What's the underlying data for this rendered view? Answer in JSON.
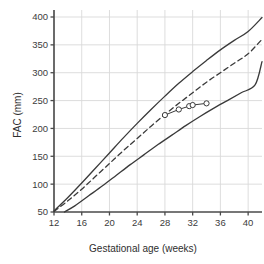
{
  "chart_data": {
    "type": "line",
    "title": "",
    "xlabel": "Gestational age (weeks)",
    "ylabel": "FAC (mm)",
    "xlim": [
      12,
      42
    ],
    "ylim": [
      50,
      400
    ],
    "xticks": [
      12,
      16,
      20,
      24,
      28,
      32,
      36,
      40
    ],
    "yticks": [
      50,
      100,
      150,
      200,
      250,
      300,
      350,
      400
    ],
    "grid": true,
    "legend": "none",
    "colors": {
      "curve": "#3a3a3a",
      "grid": "#d9d9d9",
      "axis": "#555555",
      "marker_fill": "#ffffff",
      "marker_stroke": "#3a3a3a",
      "background": "#ffffff",
      "text": "#333333"
    },
    "series": [
      {
        "name": "upper reference centile",
        "style": "solid",
        "x": [
          12,
          14,
          16,
          18,
          20,
          22,
          24,
          26,
          28,
          30,
          32,
          34,
          36,
          38,
          40,
          42
        ],
        "y": [
          52,
          76,
          102,
          129,
          156,
          183,
          209,
          234,
          258,
          281,
          302,
          322,
          341,
          358,
          374,
          399
        ]
      },
      {
        "name": "median reference",
        "style": "dashed",
        "x": [
          12,
          14,
          16,
          18,
          20,
          22,
          24,
          26,
          28,
          30,
          32,
          34,
          36,
          38,
          40,
          42
        ],
        "y": [
          51,
          70,
          91,
          114,
          137,
          160,
          182,
          204,
          225,
          245,
          264,
          283,
          300,
          317,
          334,
          360
        ]
      },
      {
        "name": "lower reference centile",
        "style": "solid",
        "x": [
          13.5,
          15,
          17,
          19,
          21,
          23,
          25,
          27,
          29,
          31,
          33,
          35,
          37,
          39,
          41,
          42
        ],
        "y": [
          50,
          61,
          79,
          97,
          116,
          135,
          153,
          171,
          188,
          205,
          221,
          236,
          250,
          264,
          278,
          320
        ]
      },
      {
        "name": "patient measurements",
        "style": "solid-with-markers",
        "marker": "open-circle",
        "x": [
          28,
          30,
          31.5,
          32,
          34
        ],
        "y": [
          224,
          234,
          240,
          242,
          245
        ]
      }
    ]
  },
  "axes": {
    "x_label": "Gestational age (weeks)",
    "y_label": "FAC (mm)",
    "x_tick_labels": [
      "12",
      "16",
      "20",
      "24",
      "28",
      "32",
      "36",
      "40"
    ],
    "y_tick_labels": [
      "50",
      "100",
      "150",
      "200",
      "250",
      "300",
      "350",
      "400"
    ]
  }
}
